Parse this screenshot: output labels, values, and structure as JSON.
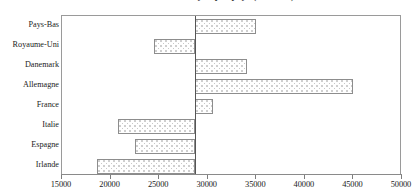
{
  "chart_data": {
    "type": "bar",
    "orientation": "horizontal",
    "title": "Salaire annuel moyen par pays (en euros)",
    "xlabel": "",
    "ylabel": "",
    "categories": [
      "Pays-Bas",
      "Royaume-Uni",
      "Danemark",
      "Allemagne",
      "France",
      "Italie",
      "Espagne",
      "Irlande"
    ],
    "values": [
      35000,
      24500,
      34000,
      45000,
      30500,
      20800,
      22500,
      18600
    ],
    "baseline": 28700,
    "xlim": [
      15000,
      50000
    ],
    "xticks": [
      15000,
      20000,
      25000,
      30000,
      35000,
      40000,
      45000,
      50000
    ],
    "xtick_labels": [
      "15000",
      "20000",
      "25000",
      "30000",
      "35000",
      "40000",
      "45000",
      "50000"
    ],
    "grid": false,
    "legend": "none",
    "bar_fill": "dotted-pattern",
    "bar_border_color": "#8d8d8d",
    "baseline_color": "#555555",
    "frame_color": "#9a9a9a"
  }
}
